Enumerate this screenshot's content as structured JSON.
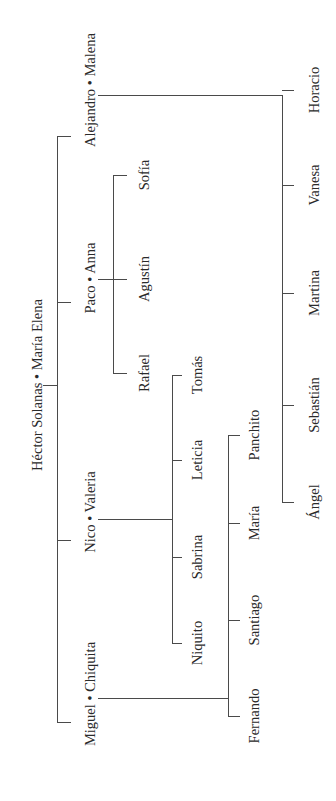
{
  "diagram": {
    "type": "family-tree",
    "orientation": "rotated-90-ccw",
    "line_color": "#4a4a4a",
    "text_color": "#2a2a2a",
    "background": "#ffffff"
  },
  "root": {
    "label": "Héctor Solanas • María Elena",
    "x": 37,
    "y": 385
  },
  "trunk": {
    "x": 57,
    "y1": 136,
    "y2": 722,
    "root_tick_x1": 40,
    "root_y": 385
  },
  "couples": [
    {
      "id": "alejandro",
      "label": "Alejandro • Malena",
      "x": 90,
      "y": 90,
      "tick_y": 136,
      "dot_y": 95,
      "bar_x": 282,
      "bar_y1": 95,
      "bar_y2": 502,
      "children": [
        {
          "label": "Horacio",
          "y": 90
        },
        {
          "label": "Vanesa",
          "y": 185
        },
        {
          "label": "Martina",
          "y": 293
        },
        {
          "label": "Sebastián",
          "y": 405
        },
        {
          "label": "Ángel",
          "y": 502
        }
      ],
      "child_x": 314,
      "tick_len": 12
    },
    {
      "id": "paco",
      "label": "Paco • Anna",
      "x": 90,
      "y": 278,
      "tick_y": 302,
      "dot_y": 279,
      "bar_x": 113,
      "bar_y1": 175,
      "bar_y2": 373,
      "children": [
        {
          "label": "Sofía",
          "y": 175
        },
        {
          "label": "Agustín",
          "y": 279
        },
        {
          "label": "Rafael",
          "y": 373
        }
      ],
      "child_x": 144,
      "tick_len": 14
    },
    {
      "id": "nico",
      "label": "Nico • Valeria",
      "x": 90,
      "y": 512,
      "tick_y": 540,
      "dot_y": 519,
      "bar_x": 172,
      "bar_y1": 375,
      "bar_y2": 643,
      "children": [
        {
          "label": "Tomás",
          "y": 375
        },
        {
          "label": "Leticia",
          "y": 460
        },
        {
          "label": "Sabrina",
          "y": 557
        },
        {
          "label": "Niquito",
          "y": 643
        }
      ],
      "child_x": 197,
      "tick_len": 10
    },
    {
      "id": "miguel",
      "label": "Miguel • Chiquita",
      "x": 90,
      "y": 694,
      "tick_y": 722,
      "dot_y": 698,
      "bar_x": 228,
      "bar_y1": 435,
      "bar_y2": 716,
      "children": [
        {
          "label": "Panchito",
          "y": 435
        },
        {
          "label": "María",
          "y": 523
        },
        {
          "label": "Santiago",
          "y": 620
        },
        {
          "label": "Fernando",
          "y": 716
        }
      ],
      "child_x": 254,
      "tick_len": 12
    }
  ]
}
